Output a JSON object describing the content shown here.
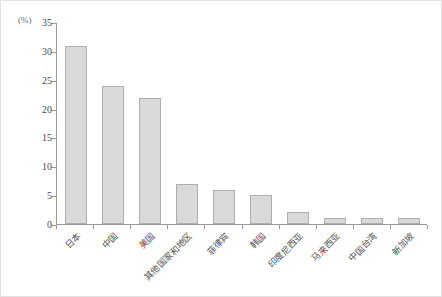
{
  "chart_data": {
    "type": "bar",
    "title": "",
    "subtitle": "",
    "xlabel": "",
    "ylabel": "(%)",
    "unit_label": "(%)",
    "ylim": [
      0,
      35
    ],
    "ytick_step": 5,
    "grid": false,
    "legend": null,
    "orientation": "vertical",
    "bar_color": "#d9d9d9",
    "bar_border_color": "#aeaeae",
    "axis_color": "#9a9a9a",
    "yticks": [
      "0",
      "5",
      "10",
      "15",
      "20",
      "25",
      "30",
      "35"
    ],
    "ytick_values": [
      0,
      5,
      10,
      15,
      20,
      25,
      30,
      35
    ],
    "categories": [
      "日本",
      "中国",
      "美国",
      "其他国家和地区",
      "菲律宾",
      "韩国",
      "印度尼西亚",
      "马来西亚",
      "中国台湾",
      "新加坡"
    ],
    "values": [
      30.8,
      23.9,
      21.9,
      6.9,
      5.9,
      5.0,
      2.0,
      1.0,
      1.0,
      1.0
    ]
  }
}
